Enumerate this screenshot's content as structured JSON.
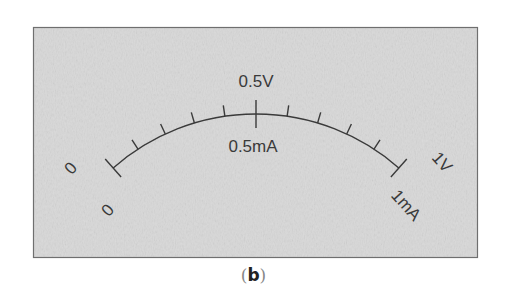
{
  "figure": {
    "caption": "b",
    "caption_open": "(",
    "caption_close": ")",
    "panel": {
      "x": 33,
      "y": 27,
      "width": 445,
      "height": 231,
      "fill": "#d6d6d6",
      "border": "#6a6a6a"
    },
    "scale": {
      "type": "meter-dial",
      "divisions": 10,
      "arc_center": [
        256,
        330
      ],
      "arc_radius": 216,
      "arc_half_angle_deg": 41.4,
      "stroke": "#3a3a3a"
    },
    "labels": {
      "voltage_zero": "0",
      "voltage_mid": "0.5V",
      "voltage_full": "1V",
      "current_zero": "0",
      "current_mid": "0.5mA",
      "current_full": "1mA"
    }
  }
}
